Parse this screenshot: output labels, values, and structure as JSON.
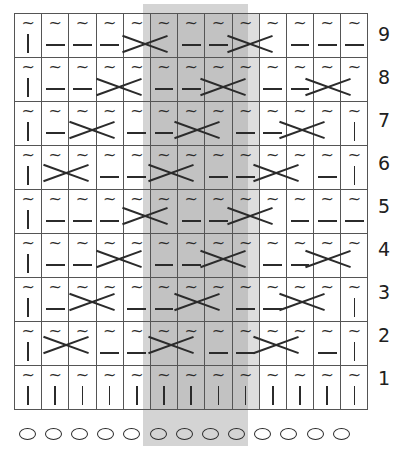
{
  "chart_data": {
    "type": "table",
    "columns": 13,
    "rows": 9,
    "row_labels": [
      "9",
      "8",
      "7",
      "6",
      "5",
      "4",
      "3",
      "2",
      "1"
    ],
    "repeat_columns": [
      6,
      7,
      8,
      9
    ],
    "repeat_shading_color": "#d4d4d4",
    "symbol_color": "#2b2b2b",
    "grid_line_color": "#555555",
    "legend_symbols": {
      "tilde": "~",
      "bar": "|",
      "dash": "—",
      "cross": "X",
      "caston": "O"
    },
    "cast_on_row": {
      "label": "cast-on",
      "symbol": "O",
      "count": 13
    },
    "grid": [
      {
        "label": "9",
        "cells": [
          "bar",
          "dash",
          "dash",
          "dash",
          "cross",
          "cross",
          "dash",
          "dash",
          "cross",
          "cross",
          "dash",
          "dash",
          "dash"
        ],
        "crosses": [
          [
            5,
            6
          ],
          [
            9,
            10
          ]
        ]
      },
      {
        "label": "8",
        "cells": [
          "bar",
          "dash",
          "dash",
          "cross",
          "cross",
          "dash",
          "dash",
          "cross",
          "cross",
          "dash",
          "dash",
          "cross",
          "cross"
        ],
        "crosses": [
          [
            4,
            5
          ],
          [
            8,
            9
          ],
          [
            12,
            13
          ]
        ]
      },
      {
        "label": "7",
        "cells": [
          "bar",
          "dash",
          "cross",
          "cross",
          "dash",
          "dash",
          "cross",
          "cross",
          "dash",
          "dash",
          "cross",
          "cross",
          "bar"
        ],
        "crosses": [
          [
            3,
            4
          ],
          [
            7,
            8
          ],
          [
            11,
            12
          ]
        ]
      },
      {
        "label": "6",
        "cells": [
          "bar",
          "cross",
          "cross",
          "dash",
          "dash",
          "cross",
          "cross",
          "dash",
          "dash",
          "cross",
          "cross",
          "dash",
          "bar"
        ],
        "crosses": [
          [
            2,
            3
          ],
          [
            6,
            7
          ],
          [
            10,
            11
          ]
        ]
      },
      {
        "label": "5",
        "cells": [
          "bar",
          "dash",
          "dash",
          "dash",
          "cross",
          "cross",
          "dash",
          "dash",
          "cross",
          "cross",
          "dash",
          "dash",
          "dash"
        ],
        "crosses": [
          [
            5,
            6
          ],
          [
            9,
            10
          ]
        ]
      },
      {
        "label": "4",
        "cells": [
          "bar",
          "dash",
          "dash",
          "cross",
          "cross",
          "dash",
          "dash",
          "cross",
          "cross",
          "dash",
          "dash",
          "cross",
          "cross"
        ],
        "crosses": [
          [
            4,
            5
          ],
          [
            8,
            9
          ],
          [
            12,
            13
          ]
        ]
      },
      {
        "label": "3",
        "cells": [
          "bar",
          "dash",
          "cross",
          "cross",
          "dash",
          "dash",
          "cross",
          "cross",
          "dash",
          "dash",
          "cross",
          "cross",
          "bar"
        ],
        "crosses": [
          [
            3,
            4
          ],
          [
            7,
            8
          ],
          [
            11,
            12
          ]
        ]
      },
      {
        "label": "2",
        "cells": [
          "bar",
          "cross",
          "cross",
          "dash",
          "dash",
          "cross",
          "cross",
          "dash",
          "dash",
          "cross",
          "cross",
          "dash",
          "bar"
        ],
        "crosses": [
          [
            2,
            3
          ],
          [
            6,
            7
          ],
          [
            10,
            11
          ]
        ]
      },
      {
        "label": "1",
        "cells": [
          "bar",
          "bar",
          "bar",
          "bar",
          "bar",
          "bar",
          "bar",
          "bar",
          "bar",
          "bar",
          "bar",
          "bar",
          "bar"
        ],
        "crosses": []
      }
    ]
  }
}
